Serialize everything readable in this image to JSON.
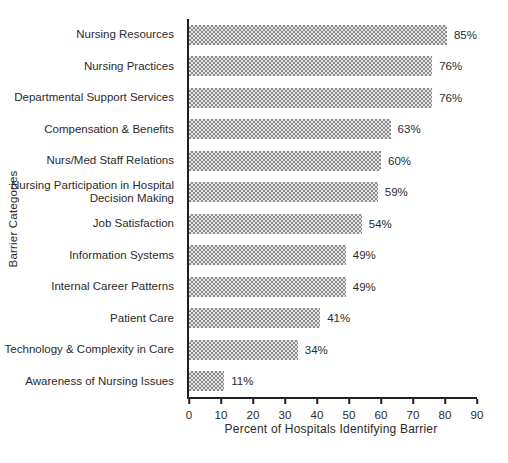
{
  "chart_data": {
    "type": "bar",
    "orientation": "horizontal",
    "title": "",
    "categories": [
      "Nursing Resources",
      "Nursing Practices",
      "Departmental Support Services",
      "Compensation & Benefits",
      "Nurs/Med Staff Relations",
      "Nursing Participation in Hospital Decision Making",
      "Job Satisfaction",
      "Information Systems",
      "Internal Career Patterns",
      "Patient Care",
      "Technology & Complexity in Care",
      "Awareness of Nursing Issues"
    ],
    "values": [
      85,
      76,
      76,
      63,
      60,
      59,
      54,
      49,
      49,
      41,
      34,
      11
    ],
    "value_labels": [
      "85%",
      "76%",
      "76%",
      "63%",
      "60%",
      "59%",
      "54%",
      "49%",
      "49%",
      "41%",
      "34%",
      "11%"
    ],
    "xlabel": "Percent of Hospitals Identifying Barrier",
    "ylabel": "Barrier Categories",
    "xlim": [
      0,
      90
    ],
    "xticks": [
      0,
      10,
      20,
      30,
      40,
      50,
      60,
      70,
      80,
      90
    ],
    "grid": false,
    "legend": "none",
    "bar_fill": "dotted-hatch-gray",
    "bar_base_color": "#e4e4e4",
    "bar_dot_color": "#8d8d8d",
    "axis_color": "#1f1f1f"
  }
}
